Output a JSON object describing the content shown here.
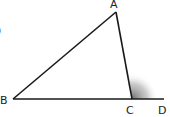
{
  "diagram": {
    "type": "triangle-exterior-angle",
    "points": {
      "A": {
        "label": "A",
        "x": 116,
        "y": 12
      },
      "B": {
        "label": "B",
        "x": 13,
        "y": 99
      },
      "C": {
        "label": "C",
        "x": 132,
        "y": 99
      },
      "D": {
        "label": "D",
        "x": 164,
        "y": 99
      }
    },
    "segments": [
      "AB",
      "AC",
      "BD"
    ],
    "shaded_angle": "ACD",
    "colors": {
      "line": "#1a1a1a",
      "shade": "#888888",
      "background": "#ffffff"
    },
    "partial_left_glyph": ")"
  }
}
